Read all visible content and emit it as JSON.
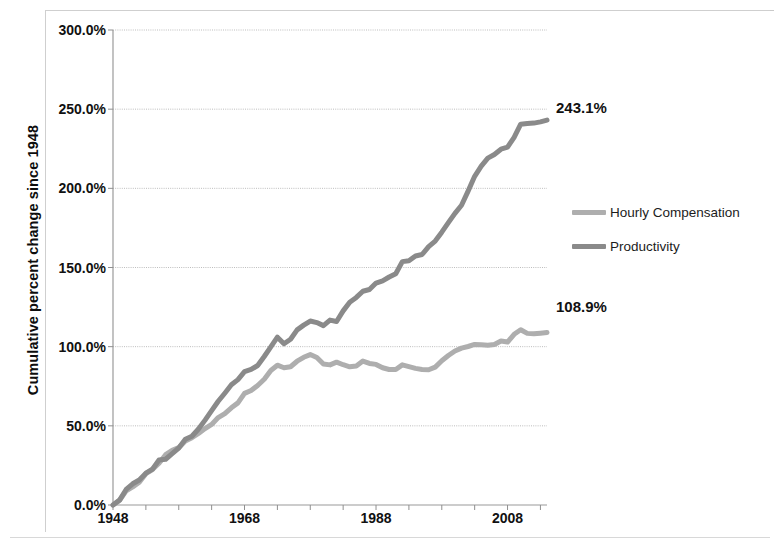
{
  "chart_data": {
    "type": "line",
    "title": "",
    "xlabel": "",
    "ylabel": "Cumulative percent change since 1948",
    "xlim": [
      1948,
      2014
    ],
    "ylim": [
      0,
      300
    ],
    "grid": true,
    "legend_position": "right",
    "x_tick_labels": [
      "1948",
      "1968",
      "1988",
      "2008"
    ],
    "x_tick_values": [
      1948,
      1968,
      1988,
      2008
    ],
    "y_tick_labels": [
      "0.0%",
      "50.0%",
      "100.0%",
      "150.0%",
      "200.0%",
      "250.0%",
      "300.0%"
    ],
    "y_tick_values": [
      0,
      50,
      100,
      150,
      200,
      250,
      300
    ],
    "x": [
      1948,
      1949,
      1950,
      1951,
      1952,
      1953,
      1954,
      1955,
      1956,
      1957,
      1958,
      1959,
      1960,
      1961,
      1962,
      1963,
      1964,
      1965,
      1966,
      1967,
      1968,
      1969,
      1970,
      1971,
      1972,
      1973,
      1974,
      1975,
      1976,
      1977,
      1978,
      1979,
      1980,
      1981,
      1982,
      1983,
      1984,
      1985,
      1986,
      1987,
      1988,
      1989,
      1990,
      1991,
      1992,
      1993,
      1994,
      1995,
      1996,
      1997,
      1998,
      1999,
      2000,
      2001,
      2002,
      2003,
      2004,
      2005,
      2006,
      2007,
      2008,
      2009,
      2010,
      2011,
      2012,
      2013,
      2014
    ],
    "series": [
      {
        "name": "Productivity",
        "color": "#8a8a8a",
        "end_value_label": "243.1%",
        "values": [
          0,
          3.1,
          9.8,
          13.4,
          15.8,
          20.1,
          22.6,
          28.4,
          28.9,
          32.5,
          36.0,
          41.5,
          43.4,
          48.0,
          53.6,
          59.6,
          65.5,
          70.6,
          75.9,
          79.2,
          84.2,
          85.6,
          88.1,
          93.8,
          99.9,
          106.0,
          101.8,
          104.7,
          110.6,
          113.6,
          116.2,
          115.2,
          113.3,
          116.8,
          115.9,
          122.6,
          128.1,
          131.1,
          135.0,
          136.1,
          140.2,
          141.6,
          144.0,
          146.1,
          153.7,
          154.3,
          157.3,
          158.2,
          163.2,
          166.7,
          172.3,
          178.3,
          184.2,
          189.3,
          198.2,
          207.6,
          214.0,
          219.1,
          221.4,
          224.7,
          226.0,
          232.2,
          240.5,
          240.9,
          241.2,
          242.0,
          243.1
        ]
      },
      {
        "name": "Hourly Compensation",
        "color": "#aeaeae",
        "end_value_label": "108.9%",
        "values": [
          0,
          2.9,
          8.9,
          11.4,
          14.4,
          19.8,
          22.4,
          26.4,
          31.8,
          34.5,
          36.2,
          40.4,
          42.5,
          45.2,
          48.3,
          50.9,
          55.2,
          57.7,
          61.4,
          64.5,
          70.5,
          72.3,
          75.5,
          79.4,
          85.0,
          88.3,
          86.7,
          87.3,
          90.8,
          93.3,
          95.0,
          93.1,
          89.0,
          88.5,
          90.2,
          88.6,
          87.3,
          87.8,
          90.9,
          89.4,
          88.8,
          86.7,
          85.6,
          85.6,
          88.5,
          87.4,
          86.3,
          85.6,
          85.4,
          87.1,
          91.1,
          94.4,
          97.3,
          99.1,
          100.1,
          101.4,
          101.2,
          100.9,
          101.4,
          103.6,
          102.9,
          107.8,
          110.7,
          108.4,
          108.1,
          108.5,
          108.9
        ]
      }
    ]
  },
  "legend": {
    "items": [
      {
        "label": "Hourly Compensation",
        "color": "#aeaeae"
      },
      {
        "label": "Productivity",
        "color": "#8a8a8a"
      }
    ]
  },
  "labels": {
    "productivity_end": "243.1%",
    "compensation_end": "108.9%"
  }
}
